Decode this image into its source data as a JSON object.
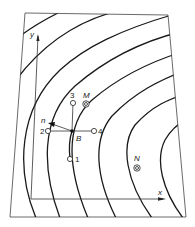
{
  "diagram": {
    "axes": {
      "x_label": "x",
      "y_label": "y"
    },
    "normal_label": "n",
    "center_label": "B",
    "grid_points": [
      {
        "id": "1",
        "label": "1"
      },
      {
        "id": "2",
        "label": "2"
      },
      {
        "id": "3",
        "label": "3"
      },
      {
        "id": "4",
        "label": "4"
      }
    ],
    "targets": [
      {
        "id": "M",
        "label": "M"
      },
      {
        "id": "N",
        "label": "N"
      }
    ],
    "contour_count": 8,
    "colors": {
      "line": "#1a1a1a",
      "frame": "#444444",
      "background": "#ffffff"
    }
  }
}
